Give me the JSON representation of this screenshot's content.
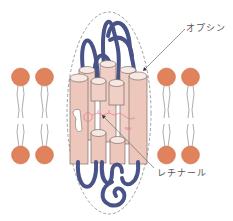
{
  "diagram": {
    "labels": {
      "opsin": "オプシン",
      "retinal": "レチナール"
    },
    "colors": {
      "lipid_head": "#e0825c",
      "lipid_tail": "#8a8a8a",
      "helix_fill": "#f0cfc6",
      "helix_top": "#f8e8e3",
      "helix_stroke": "#555555",
      "loop": "#4a5387",
      "retinal": "#e86a7a",
      "boundary": "#777777",
      "label_text": "#555555"
    },
    "terminals": {
      "c_terminal": "C",
      "n_terminal": "N"
    },
    "lipids": [
      {
        "x": 20,
        "side": "left"
      },
      {
        "x": 44,
        "side": "left"
      },
      {
        "x": 166,
        "side": "right"
      },
      {
        "x": 190,
        "side": "right"
      }
    ],
    "helix_count": 7
  }
}
